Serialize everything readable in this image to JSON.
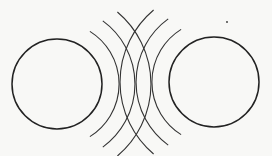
{
  "diagram": {
    "stroke_color": "#222222",
    "background_color": "#f8f8f6",
    "left_circle": {
      "cx": 57,
      "cy": 84,
      "r": 45
    },
    "right_circle": {
      "cx": 214,
      "cy": 82,
      "r": 45
    },
    "left_arcs_radii": [
      62,
      78,
      94
    ],
    "right_arcs_radii": [
      62,
      78,
      94
    ],
    "dot": {
      "cx": 227,
      "cy": 22
    }
  }
}
